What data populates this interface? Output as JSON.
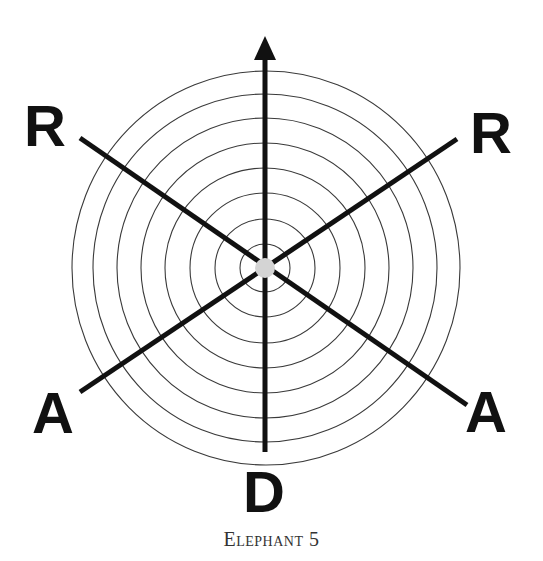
{
  "figure": {
    "caption": "Elephant 5",
    "labels": {
      "top_left": "R",
      "top_right": "R",
      "bottom_left": "A",
      "bottom_right": "A",
      "bottom": "D"
    },
    "rings_count": 8,
    "colors": {
      "lines": "#111111",
      "rings": "#3a3a3a",
      "center_dot": "#d4d4d4",
      "background": "#ffffff"
    },
    "icons": {
      "top_arrow": "arrow-up-icon"
    }
  }
}
